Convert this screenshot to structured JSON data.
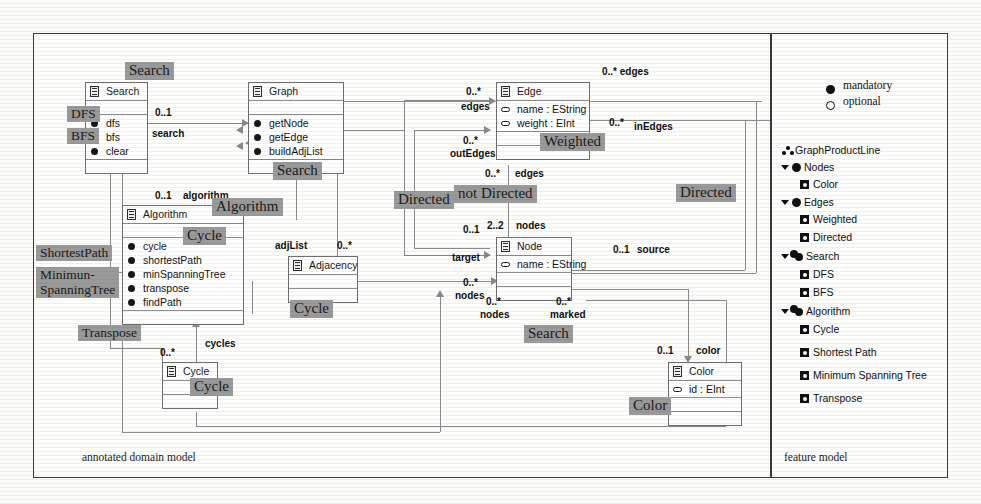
{
  "frame": {
    "left_caption": "annotated domain model",
    "right_caption": "feature model"
  },
  "classes": {
    "search": {
      "name": "Search",
      "attributes": [],
      "operations": [
        "dfs",
        "bfs",
        "clear"
      ]
    },
    "graph": {
      "name": "Graph",
      "attributes": [],
      "operations": [
        "getNode",
        "getEdge",
        "buildAdjList"
      ]
    },
    "algorithm": {
      "name": "Algorithm",
      "attributes": [],
      "operations": [
        "cycle",
        "shortestPath",
        "minSpanningTree",
        "transpose",
        "findPath"
      ]
    },
    "adjacency": {
      "name": "Adjacency",
      "attributes": [],
      "operations": []
    },
    "cycle": {
      "name": "Cycle",
      "attributes": [],
      "operations": []
    },
    "edge": {
      "name": "Edge",
      "attributes": [
        "name : EString",
        "weight : EInt"
      ],
      "operations": []
    },
    "node": {
      "name": "Node",
      "attributes": [
        "name : EString"
      ],
      "operations": []
    },
    "color": {
      "name": "Color",
      "attributes": [
        "id : EInt"
      ],
      "operations": []
    }
  },
  "edge_labels": [
    {
      "id": "search_mult",
      "text": "0..1"
    },
    {
      "id": "search_role",
      "text": "search"
    },
    {
      "id": "algorithm_mult",
      "text": "0..1"
    },
    {
      "id": "algorithm_role",
      "text": "algorithm"
    },
    {
      "id": "adjlist_role",
      "text": "adjList"
    },
    {
      "id": "adjlist_mult",
      "text": "0..*"
    },
    {
      "id": "cycles_mult",
      "text": "0..*"
    },
    {
      "id": "cycles_role",
      "text": "cycles"
    },
    {
      "id": "edges_top_mult",
      "text": "0..* edges"
    },
    {
      "id": "edges_left_mult",
      "text": "0..*"
    },
    {
      "id": "edges_left_role",
      "text": "edges"
    },
    {
      "id": "inedges_mult",
      "text": "0..*"
    },
    {
      "id": "inedges_role",
      "text": "inEdges"
    },
    {
      "id": "outedges_mult",
      "text": "0..*"
    },
    {
      "id": "outedges_role",
      "text": "outEdges"
    },
    {
      "id": "edges_mid_mult",
      "text": "0..*"
    },
    {
      "id": "edges_mid_role",
      "text": "edges"
    },
    {
      "id": "nodes22_mult",
      "text": "2..2"
    },
    {
      "id": "nodes22_role",
      "text": "nodes"
    },
    {
      "id": "target_mult",
      "text": "0..1"
    },
    {
      "id": "target_role",
      "text": "target"
    },
    {
      "id": "source_mult",
      "text": "0..1"
    },
    {
      "id": "source_role",
      "text": "source"
    },
    {
      "id": "nodes_l_mult",
      "text": "0..*"
    },
    {
      "id": "nodes_l_role",
      "text": "nodes"
    },
    {
      "id": "nodes_b_mult",
      "text": "0..*"
    },
    {
      "id": "nodes_b_role",
      "text": "nodes"
    },
    {
      "id": "marked_mult",
      "text": "0..*"
    },
    {
      "id": "marked_role",
      "text": "marked"
    },
    {
      "id": "color_mult",
      "text": "0..1"
    },
    {
      "id": "color_role",
      "text": "color"
    }
  ],
  "annotations": [
    {
      "id": "ann-search-top",
      "text": "Search"
    },
    {
      "id": "ann-dfs",
      "text": "DFS"
    },
    {
      "id": "ann-bfs",
      "text": "BFS"
    },
    {
      "id": "ann-search-graph",
      "text": "Search"
    },
    {
      "id": "ann-algorithm",
      "text": "Algorithm"
    },
    {
      "id": "ann-cycle-alg",
      "text": "Cycle"
    },
    {
      "id": "ann-shortestpath",
      "text": "ShortestPath"
    },
    {
      "id": "ann-minspanningtree",
      "text": "Minimun-\nSpanningTree"
    },
    {
      "id": "ann-transpose",
      "text": "Transpose"
    },
    {
      "id": "ann-cycle-adj",
      "text": "Cycle"
    },
    {
      "id": "ann-cycle-cls",
      "text": "Cycle"
    },
    {
      "id": "ann-weighted",
      "text": "Weighted"
    },
    {
      "id": "ann-notdirected",
      "text": "not Directed"
    },
    {
      "id": "ann-directed-left",
      "text": "Directed"
    },
    {
      "id": "ann-directed-right",
      "text": "Directed"
    },
    {
      "id": "ann-search-nodes",
      "text": "Search"
    },
    {
      "id": "ann-color",
      "text": "Color"
    }
  ],
  "feature_model": {
    "legend": [
      {
        "symbol": "mandatory-dot",
        "label": "mandatory"
      },
      {
        "symbol": "optional-ring",
        "label": "optional"
      }
    ],
    "tree": [
      {
        "label": "GraphProductLine",
        "kind": "root",
        "indent": 0,
        "expander": false
      },
      {
        "label": "Nodes",
        "kind": "mandatory",
        "indent": 0,
        "expander": true
      },
      {
        "label": "Color",
        "kind": "optional",
        "indent": 1,
        "expander": false
      },
      {
        "label": "Edges",
        "kind": "mandatory",
        "indent": 0,
        "expander": true
      },
      {
        "label": "Weighted",
        "kind": "optional",
        "indent": 1,
        "expander": false
      },
      {
        "label": "Directed",
        "kind": "optional",
        "indent": 1,
        "expander": false
      },
      {
        "label": "Search",
        "kind": "group",
        "indent": 0,
        "expander": true
      },
      {
        "label": "DFS",
        "kind": "optional",
        "indent": 1,
        "expander": false
      },
      {
        "label": "BFS",
        "kind": "optional",
        "indent": 1,
        "expander": false
      },
      {
        "label": "Algorithm",
        "kind": "group",
        "indent": 0,
        "expander": true
      },
      {
        "label": "Cycle",
        "kind": "optional",
        "indent": 1,
        "expander": false
      },
      {
        "label": "Shortest Path",
        "kind": "optional",
        "indent": 1,
        "expander": false
      },
      {
        "label": "Minimum Spanning Tree",
        "kind": "optional",
        "indent": 1,
        "expander": false
      },
      {
        "label": "Transpose",
        "kind": "optional",
        "indent": 1,
        "expander": false
      }
    ]
  },
  "colors": {
    "annotation_bg": "#9a9a9a",
    "line": "#8a8a8a",
    "frame": "#3a3a3a",
    "class_border": "#6e6e6e",
    "text": "#141414"
  }
}
